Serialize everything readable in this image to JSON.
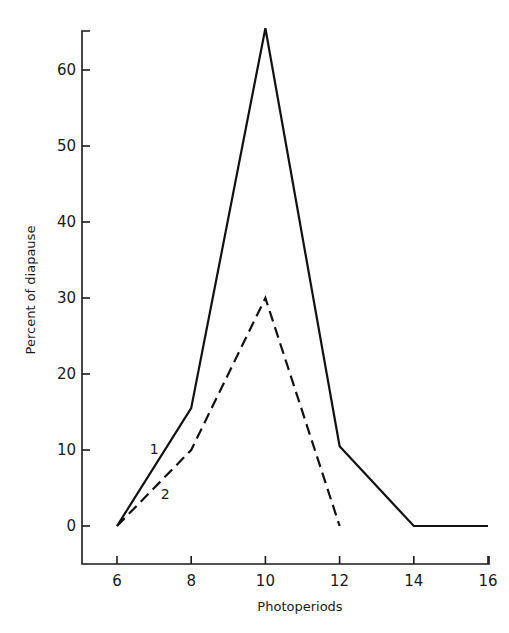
{
  "chart_data": {
    "type": "line",
    "title": "",
    "xlabel": "Photoperiods",
    "ylabel": "Percent of diapause",
    "x": [
      6,
      8,
      10,
      12,
      14,
      16
    ],
    "xticks": [
      "6",
      "8",
      "10",
      "12",
      "14",
      "16"
    ],
    "yticks": [
      "0",
      "10",
      "20",
      "30",
      "40",
      "50",
      "60"
    ],
    "xlim": [
      5.1,
      16
    ],
    "ylim": [
      -5,
      66
    ],
    "grid": false,
    "legend": "none (inline line labels '1' and '2')",
    "series": [
      {
        "name": "1",
        "style": "solid",
        "x": [
          6,
          8,
          10,
          12,
          14,
          16
        ],
        "values": [
          0,
          15.5,
          65.5,
          10.5,
          0,
          0
        ]
      },
      {
        "name": "2",
        "style": "dashed",
        "x": [
          6,
          8,
          10,
          12
        ],
        "values": [
          0,
          10,
          30,
          0
        ]
      }
    ],
    "annotations": [
      {
        "text": "1",
        "near_x": 7.0,
        "near_y": 9.5
      },
      {
        "text": "2",
        "near_x": 7.3,
        "near_y": 3.5
      }
    ]
  }
}
